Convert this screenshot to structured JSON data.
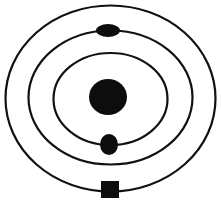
{
  "diagram": {
    "colors": {
      "background": "#ffffff",
      "stroke": "#111111",
      "fill": "#0d0d0d"
    },
    "orbits": [
      {
        "name": "inner-orbit",
        "cx": 110.5,
        "cy": 99,
        "rx": 57,
        "ry": 46
      },
      {
        "name": "middle-orbit",
        "cx": 110.5,
        "cy": 97.5,
        "rx": 82,
        "ry": 67
      },
      {
        "name": "outer-orbit",
        "cx": 110.5,
        "cy": 98.5,
        "rx": 105,
        "ry": 93
      }
    ],
    "nucleus": {
      "cx": 108,
      "cy": 97,
      "rx": 19,
      "ry": 18
    },
    "particles": [
      {
        "name": "particle-top-oval",
        "shape": "ellipse",
        "cx": 108,
        "cy": 30.5,
        "rx": 12,
        "ry": 6.5
      },
      {
        "name": "particle-bottom-oval",
        "shape": "ellipse",
        "cx": 109,
        "cy": 144.5,
        "rx": 9,
        "ry": 10.5
      },
      {
        "name": "particle-bottom-square",
        "shape": "rect",
        "x": 101,
        "y": 181,
        "w": 18,
        "h": 17
      }
    ]
  }
}
